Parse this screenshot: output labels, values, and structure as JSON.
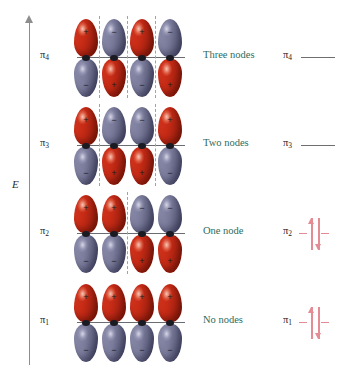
{
  "diagram": {
    "energy_axis_label": "E",
    "colors": {
      "positive_lobe": "#c62b16",
      "negative_lobe": "#7b7c9b",
      "node_line": "#8fae96",
      "node_text": "#2f6b5c",
      "electron_arrow": "#e58b94",
      "bond_line": "#6b6b72",
      "axis": "#8d8d8d"
    }
  },
  "chart_data": {
    "type": "diagram",
    "ylabel": "E",
    "levels": [
      {
        "symbol": "π",
        "subscript": "4",
        "node_text": "Three nodes",
        "node_count": 3,
        "electrons": 0,
        "occupied": false,
        "phases": [
          "+",
          "-",
          "+",
          "-"
        ],
        "node_positions": [
          1,
          2,
          3
        ]
      },
      {
        "symbol": "π",
        "subscript": "3",
        "node_text": "Two nodes",
        "node_count": 2,
        "electrons": 0,
        "occupied": false,
        "phases": [
          "+",
          "-",
          "-",
          "+"
        ],
        "node_positions": [
          1,
          3
        ]
      },
      {
        "symbol": "π",
        "subscript": "2",
        "node_text": "One node",
        "node_count": 1,
        "electrons": 2,
        "occupied": true,
        "phases": [
          "+",
          "+",
          "-",
          "-"
        ],
        "node_positions": [
          2
        ]
      },
      {
        "symbol": "π",
        "subscript": "1",
        "node_text": "No nodes",
        "node_count": 0,
        "electrons": 2,
        "occupied": true,
        "phases": [
          "+",
          "+",
          "+",
          "+"
        ],
        "node_positions": []
      }
    ]
  }
}
